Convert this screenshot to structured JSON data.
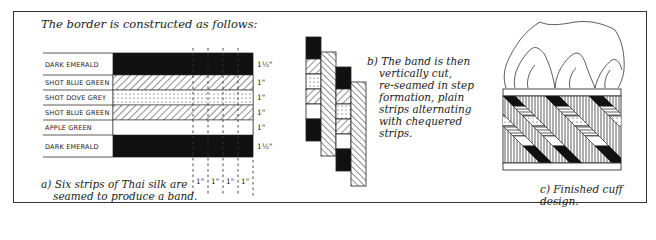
{
  "title": "The border is constructed as follows:",
  "panel_a": {
    "caption_line1": "a) Six strips of Thai silk are",
    "caption_line2": "seamed to produce a band.",
    "strips": [
      {
        "label": "DARK EMERALD",
        "width": "1½\"",
        "pattern": "solid-black"
      },
      {
        "label": "SHOT BLUE GREEN",
        "width": "1\"",
        "pattern": "diagonal-hatch"
      },
      {
        "label": "SHOT DOVE GREY",
        "width": "1\"",
        "pattern": "dotted"
      },
      {
        "label": "SHOT BLUE GREEN",
        "width": "1\"",
        "pattern": "diagonal-hatch"
      },
      {
        "label": "APPLE GREEN",
        "width": "1\"",
        "pattern": "plain-white"
      },
      {
        "label": "DARK EMERALD",
        "width": "1½\"",
        "pattern": "solid-black"
      }
    ],
    "cut_widths": [
      "1\"",
      "1\"",
      "1\"",
      "1\""
    ]
  },
  "panel_b": {
    "caption_lines": [
      "b) The band is then",
      "vertically cut,",
      "re-seamed in step",
      "formation, plain",
      "strips alternating",
      "with chequered",
      "strips."
    ]
  },
  "panel_c": {
    "caption": "c) Finished cuff design."
  }
}
